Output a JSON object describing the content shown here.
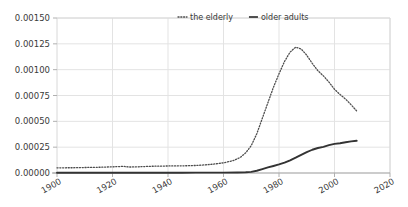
{
  "chart_data": {
    "type": "line",
    "title": "",
    "subtitle": "",
    "xlabel": "",
    "ylabel": "",
    "xlim": [
      1900,
      2020
    ],
    "ylim": [
      0.0,
      0.0015
    ],
    "grid": true,
    "legend_position": "top-center",
    "x_ticks": [
      "1900",
      "1920",
      "1940",
      "1960",
      "1980",
      "2000",
      "2020"
    ],
    "x_tick_values": [
      1900,
      1920,
      1940,
      1960,
      1980,
      2000,
      2020
    ],
    "y_ticks": [
      "0.00000",
      "0.00025",
      "0.00050",
      "0.00075",
      "0.00100",
      "0.00125",
      "0.00150"
    ],
    "y_tick_values": [
      0.0,
      0.00025,
      0.0005,
      0.00075,
      0.001,
      0.00125,
      0.0015
    ],
    "series": [
      {
        "name": "the elderly",
        "style": "dotted",
        "color": "#4d4d4d",
        "x": [
          1900,
          1902,
          1904,
          1906,
          1908,
          1910,
          1912,
          1914,
          1916,
          1918,
          1920,
          1922,
          1924,
          1926,
          1928,
          1930,
          1932,
          1934,
          1936,
          1938,
          1940,
          1942,
          1944,
          1946,
          1948,
          1950,
          1952,
          1954,
          1956,
          1958,
          1960,
          1962,
          1964,
          1966,
          1968,
          1970,
          1972,
          1974,
          1976,
          1978,
          1980,
          1982,
          1984,
          1986,
          1988,
          1990,
          1992,
          1994,
          1996,
          1998,
          2000,
          2002,
          2004,
          2006,
          2008
        ],
        "values": [
          5e-05,
          5e-05,
          5.1e-05,
          5.1e-05,
          5.2e-05,
          5.3e-05,
          5.4e-05,
          5.5e-05,
          5.6e-05,
          5.8e-05,
          6e-05,
          6.2e-05,
          6.4e-05,
          5.8e-05,
          5.9e-05,
          6.1e-05,
          6.3e-05,
          6.5e-05,
          6.6e-05,
          6.7e-05,
          6.8e-05,
          6.8e-05,
          6.9e-05,
          7e-05,
          7.1e-05,
          7.3e-05,
          7.6e-05,
          8e-05,
          8.5e-05,
          9.1e-05,
          9.9e-05,
          0.00011,
          0.000125,
          0.00015,
          0.000195,
          0.000265,
          0.00038,
          0.00053,
          0.00068,
          0.00083,
          0.00096,
          0.00108,
          0.00117,
          0.001218,
          0.0012,
          0.00114,
          0.00106,
          0.00099,
          0.00094,
          0.00088,
          0.00081,
          0.00076,
          0.000715,
          0.00066,
          0.0006
        ]
      },
      {
        "name": "older adults",
        "style": "solid",
        "color": "#333333",
        "x": [
          1900,
          1905,
          1910,
          1915,
          1920,
          1925,
          1930,
          1935,
          1940,
          1945,
          1950,
          1955,
          1960,
          1965,
          1968,
          1970,
          1972,
          1974,
          1976,
          1978,
          1980,
          1982,
          1984,
          1986,
          1988,
          1990,
          1992,
          1994,
          1996,
          1998,
          2000,
          2002,
          2004,
          2006,
          2008
        ],
        "values": [
          2e-06,
          2e-06,
          2.1e-06,
          2.2e-06,
          2.3e-06,
          2.4e-06,
          2.5e-06,
          2.6e-06,
          2.8e-06,
          3e-06,
          3.3e-06,
          3.6e-06,
          4e-06,
          5e-06,
          7e-06,
          1.1e-05,
          2.2e-05,
          3.8e-05,
          5.4e-05,
          6.8e-05,
          8.3e-05,
          0.0001,
          0.000123,
          0.000148,
          0.000175,
          0.000202,
          0.000225,
          0.000242,
          0.000253,
          0.00027,
          0.000282,
          0.000288,
          0.000298,
          0.000306,
          0.000312
        ]
      }
    ]
  },
  "legend": {
    "entries": [
      {
        "label": "the elderly",
        "marker": "dotted-line-marker"
      },
      {
        "label": "older adults",
        "marker": "solid-line-marker"
      }
    ]
  },
  "style": {
    "grid_color": "#e3e3e3",
    "axis_color": "#b0b0b0",
    "text_color": "#3a3a3a",
    "background": "#ffffff"
  }
}
